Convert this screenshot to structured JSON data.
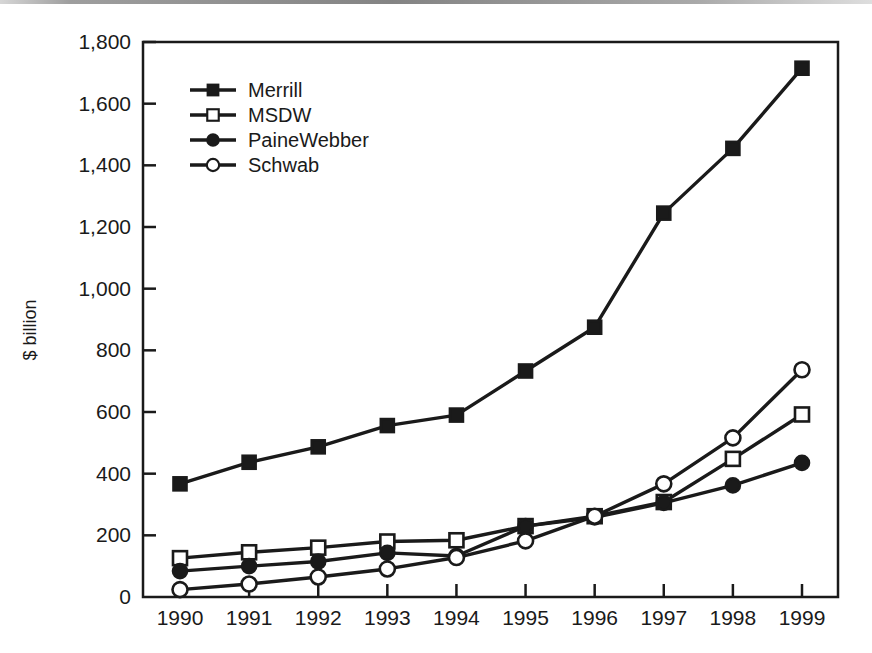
{
  "chart_data": {
    "type": "line",
    "title": "",
    "subtitle": "",
    "xlabel": "",
    "ylabel": "$ billion",
    "categories": [
      "1990",
      "1991",
      "1992",
      "1993",
      "1994",
      "1995",
      "1996",
      "1997",
      "1998",
      "1999"
    ],
    "x": [
      1990,
      1991,
      1992,
      1993,
      1994,
      1995,
      1996,
      1997,
      1998,
      1999
    ],
    "xlim": [
      1990,
      1999
    ],
    "ylim": [
      0,
      1800
    ],
    "yticks": [
      0,
      200,
      400,
      600,
      800,
      1000,
      1200,
      1400,
      1600,
      1800
    ],
    "ytick_labels": [
      "0",
      "200",
      "400",
      "600",
      "800",
      "1,000",
      "1,200",
      "1,400",
      "1,600",
      "1,800"
    ],
    "grid": false,
    "legend_position": "top-left-inside",
    "series": [
      {
        "name": "Merrill",
        "marker": "filled-square",
        "color": "#1a1a1a",
        "values": [
          367,
          437,
          487,
          556,
          590,
          733,
          875,
          1245,
          1455,
          1715
        ]
      },
      {
        "name": "MSDW",
        "marker": "open-square",
        "color": "#1a1a1a",
        "values": [
          126,
          145,
          160,
          180,
          184,
          230,
          262,
          308,
          448,
          592
        ]
      },
      {
        "name": "PaineWebber",
        "marker": "filled-circle",
        "color": "#1a1a1a",
        "values": [
          84,
          100,
          115,
          143,
          133,
          230,
          258,
          305,
          362,
          435
        ]
      },
      {
        "name": "Schwab",
        "marker": "open-circle",
        "color": "#1a1a1a",
        "values": [
          24,
          42,
          65,
          91,
          128,
          182,
          262,
          367,
          516,
          737
        ]
      }
    ]
  },
  "legend": {
    "entries": [
      {
        "label": "Merrill",
        "marker": "filled-square"
      },
      {
        "label": "MSDW",
        "marker": "open-square"
      },
      {
        "label": "PaineWebber",
        "marker": "filled-circle"
      },
      {
        "label": "Schwab",
        "marker": "open-circle"
      }
    ]
  },
  "style": {
    "axis_color": "#1a1a1a",
    "line_color": "#1a1a1a",
    "marker_fill_open": "#ffffff",
    "background": "#ffffff"
  }
}
